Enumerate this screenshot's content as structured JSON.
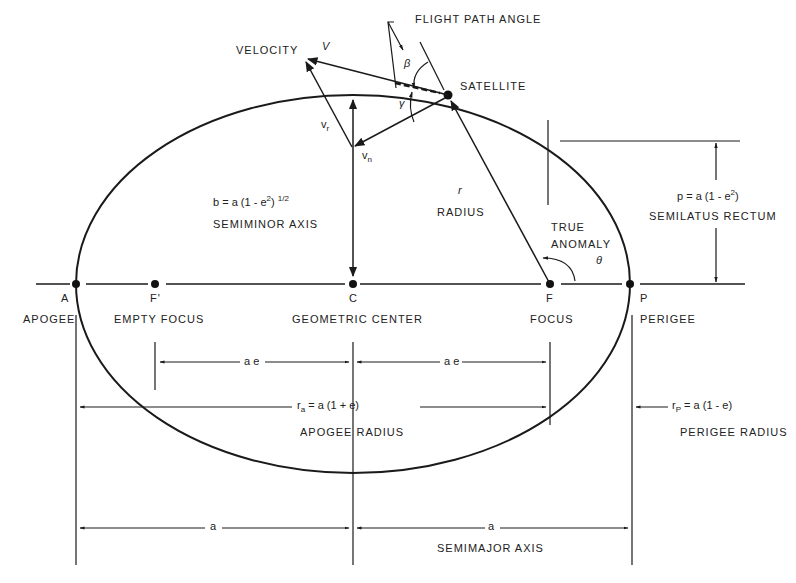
{
  "diagram": {
    "type": "orbital-ellipse",
    "labels": {
      "flight_path_angle": "FLIGHT PATH ANGLE",
      "velocity": "VELOCITY",
      "velocity_symbol": "V",
      "satellite": "SATELLITE",
      "beta": "β",
      "gamma": "γ",
      "v_r": "v",
      "v_r_sub": "r",
      "v_n": "v",
      "v_n_sub": "n",
      "semiminor_eq_lhs": "b = a (1 - e",
      "semiminor_eq_exp": "2",
      "semiminor_eq_rhs": ") ",
      "semiminor_eq_pow": "1/2",
      "semiminor_axis": "SEMIMINOR AXIS",
      "radius_symbol": "r",
      "radius": "RADIUS",
      "true_anomaly_1": "TRUE",
      "true_anomaly_2": "ANOMALY",
      "theta": "θ",
      "semilatus_eq_lhs": "p = a (1 - e",
      "semilatus_eq_exp": "2",
      "semilatus_eq_rhs": ")",
      "semilatus_rectum": "SEMILATUS RECTUM",
      "point_a": "A",
      "apogee": "APOGEE",
      "point_f_prime": "F'",
      "empty_focus": "EMPTY FOCUS",
      "point_c": "C",
      "geometric_center": "GEOMETRIC CENTER",
      "point_f": "F",
      "focus": "FOCUS",
      "point_p": "P",
      "perigee": "PERIGEE",
      "ae_left": "a e",
      "ae_right": "a e",
      "apogee_radius_eq": "r",
      "apogee_radius_sub": "a",
      "apogee_radius_rhs": " = a (1 + e)",
      "apogee_radius": "APOGEE RADIUS",
      "perigee_radius_eq": "r",
      "perigee_radius_sub": "P",
      "perigee_radius_rhs": " = a (1 - e)",
      "perigee_radius": "PERIGEE RADIUS",
      "semimajor_a_left": "a",
      "semimajor_a_right": "a",
      "semimajor_axis": "SEMIMAJOR AXIS"
    }
  }
}
